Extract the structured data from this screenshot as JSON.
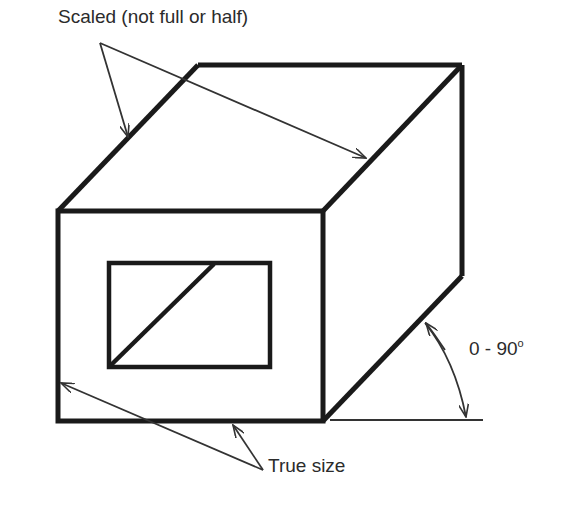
{
  "diagram": {
    "labels": {
      "scaled": "Scaled (not full or half)",
      "angle_value": "0 - 90",
      "angle_unit": "o",
      "true_size": "True size"
    },
    "colors": {
      "background": "#ffffff",
      "object_lines": "#1a1a1a",
      "leader_lines": "#333333",
      "text": "#2b2b2b"
    },
    "shapes": {
      "front_face": {
        "x1": 58,
        "y1": 211,
        "x2": 323,
        "y2": 421
      },
      "back_top_left": [
        198,
        65
      ],
      "back_top_right": [
        462,
        65
      ],
      "back_bottom_right": [
        462,
        276
      ],
      "inner_window": {
        "x1": 109,
        "y1": 263,
        "x2": 270,
        "y2": 367
      },
      "baseline": {
        "x1": 330,
        "y1": 420,
        "x2": 483,
        "y2": 420
      }
    }
  }
}
